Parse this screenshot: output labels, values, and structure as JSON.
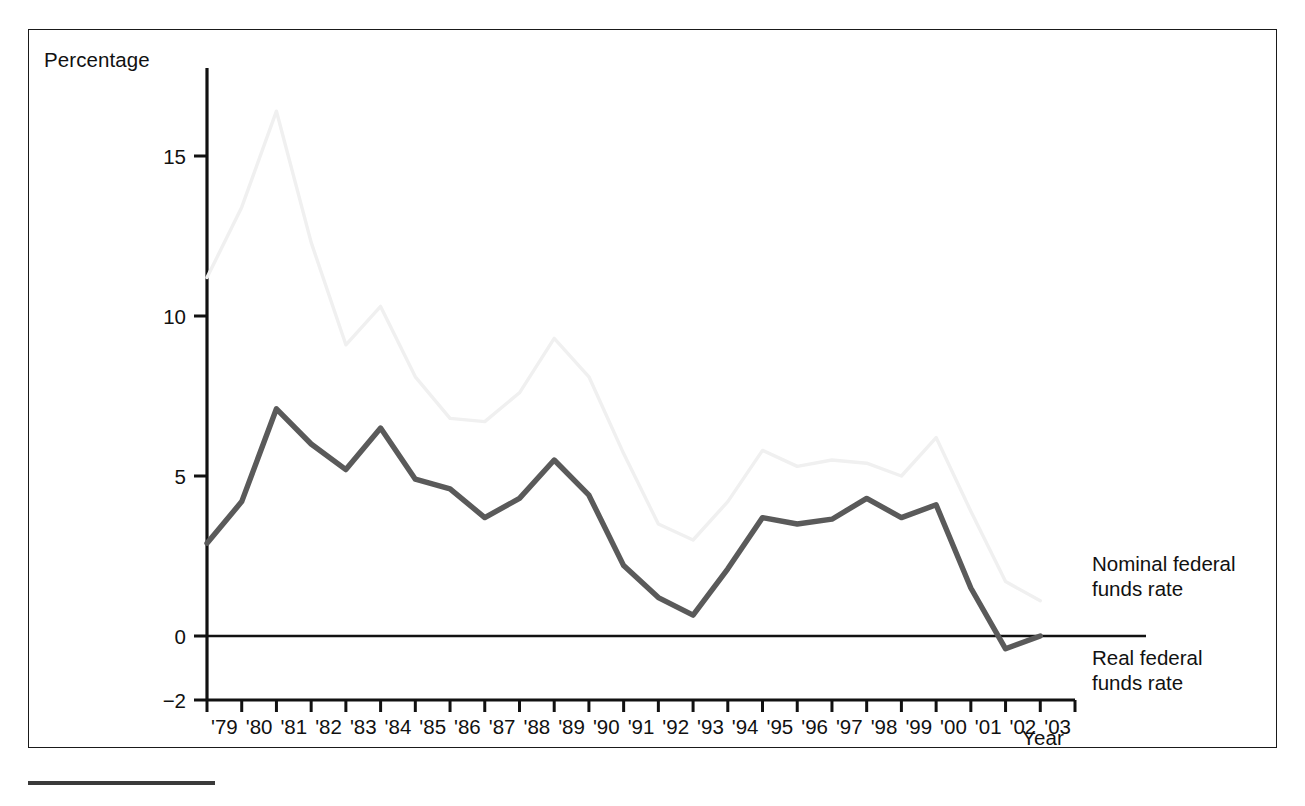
{
  "figure": {
    "axis_titles": {
      "y": "Percentage",
      "x": "Year"
    },
    "series_labels": {
      "nominal": "Nominal federal\nfunds rate",
      "nominal_line1": "Nominal federal",
      "nominal_line2": "funds rate",
      "real_line1": "Real federal",
      "real_line2": "funds rate"
    },
    "colors": {
      "nominal_line": "#f0f0f0",
      "real_line": "#5a5a5a",
      "axis": "#111111",
      "frame": "#1a1a1a",
      "background": "#ffffff"
    }
  },
  "chart_data": {
    "type": "line",
    "title": "",
    "subtitle": "",
    "xlabel": "Year",
    "ylabel": "Percentage",
    "grid": false,
    "legend_position": "right-inline",
    "xlim": [
      1978.5,
      2003.5
    ],
    "ylim": [
      -2,
      17
    ],
    "yticks": [
      -2,
      0,
      5,
      10,
      15
    ],
    "ytick_labels": [
      "−2",
      "0",
      "5",
      "10",
      "15"
    ],
    "x": [
      1979,
      1980,
      1981,
      1982,
      1983,
      1984,
      1985,
      1986,
      1987,
      1988,
      1989,
      1990,
      1991,
      1992,
      1993,
      1994,
      1995,
      1996,
      1997,
      1998,
      1999,
      2000,
      2001,
      2002,
      2003
    ],
    "xtick_labels": [
      "'79",
      "'80",
      "'81",
      "'82",
      "'83",
      "'84",
      "'85",
      "'86",
      "'87",
      "'88",
      "'89",
      "'90",
      "'91",
      "'92",
      "'93",
      "'94",
      "'95",
      "'96",
      "'97",
      "'98",
      "'99",
      "'00",
      "'01",
      "'02",
      "'03"
    ],
    "series": [
      {
        "name": "Nominal federal funds rate",
        "color": "#f0f0f0",
        "values": [
          11.2,
          13.4,
          16.4,
          12.3,
          9.1,
          10.3,
          8.1,
          6.8,
          6.7,
          7.6,
          9.3,
          8.1,
          5.7,
          3.5,
          3.0,
          4.2,
          5.8,
          5.3,
          5.5,
          5.4,
          5.0,
          6.2,
          3.9,
          1.7,
          1.1
        ]
      },
      {
        "name": "Real federal funds rate",
        "color": "#5a5a5a",
        "values": [
          2.9,
          4.2,
          7.1,
          6.0,
          5.2,
          6.5,
          4.9,
          4.6,
          3.7,
          4.3,
          5.5,
          4.4,
          2.2,
          1.2,
          0.65,
          2.1,
          3.7,
          3.5,
          3.65,
          4.3,
          3.7,
          4.1,
          1.5,
          -0.4,
          0.0
        ]
      }
    ],
    "annotations": []
  }
}
